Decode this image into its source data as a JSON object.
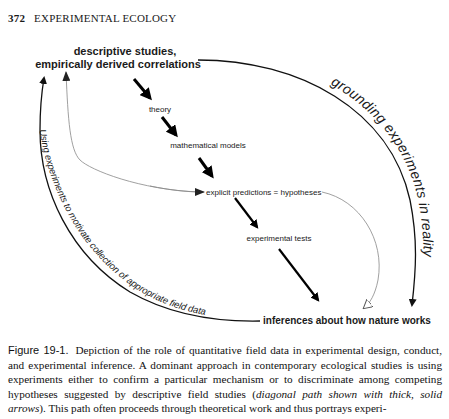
{
  "header": {
    "page_number": "372",
    "running_title": "EXPERIMENTAL ECOLOGY"
  },
  "diagram": {
    "nodes": {
      "descriptive_line1": "descriptive studies,",
      "descriptive_line2": "empirically derived correlations",
      "theory": "theory",
      "math_models": "mathematical models",
      "predictions": "explicit predictions = hypotheses",
      "tests": "experimental tests",
      "inferences": "inferences about how nature works"
    },
    "arc_labels": {
      "grounding": "grounding experiments in reality",
      "motivate": "Using experiments to motivate collection of appropriate field data"
    },
    "colors": {
      "thick_arrow": "#000000",
      "thin_arrow": "#777777",
      "arc": "#1a1a1a"
    }
  },
  "caption": {
    "figure_label": "Figure 19-1.",
    "text_1": "Depiction of the role of quantitative field data in experimental design, conduct, and experimental inference. A dominant approach in contemporary ecological studies is using experiments either to confirm a particular mechanism or to discriminate among competing hypotheses suggested by descriptive field studies (",
    "italic": "diagonal path shown with thick, solid arrows",
    "text_2": "). This path often proceeds through theoretical work and thus portrays experi-"
  }
}
